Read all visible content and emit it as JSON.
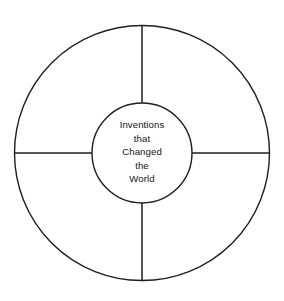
{
  "diagram": {
    "type": "concentric-circle-graphic-organizer",
    "title_lines": [
      "Inventions",
      "that",
      "Changed",
      "the",
      "World"
    ],
    "center_label": "Inventions that Changed the World",
    "segment_count": 4,
    "segments": [
      {
        "id": "segment-top-left",
        "label": ""
      },
      {
        "id": "segment-top-right",
        "label": ""
      },
      {
        "id": "segment-bottom-right",
        "label": ""
      },
      {
        "id": "segment-bottom-left",
        "label": ""
      }
    ],
    "spokes": [
      {
        "id": "spoke-top",
        "direction": "up"
      },
      {
        "id": "spoke-right",
        "direction": "right"
      },
      {
        "id": "spoke-bottom",
        "direction": "down"
      },
      {
        "id": "spoke-left",
        "direction": "left"
      }
    ],
    "geometry": {
      "center_x": 142,
      "center_y": 153,
      "outer_radius": 128,
      "inner_radius": 50
    },
    "colors": {
      "background": "#ffffff",
      "stroke": "#1e1e1e",
      "text": "#141414"
    }
  }
}
